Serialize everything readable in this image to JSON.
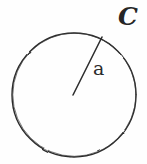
{
  "figure": {
    "kind": "geometry-diagram",
    "background_color": "#fefefe",
    "ink_color": "#262626",
    "labels": {
      "circle_label": "C",
      "radius_label": "a"
    },
    "shapes": {
      "circle": {
        "name": "circle-outline",
        "center_x": 74,
        "center_y": 95,
        "radius": 62,
        "stroke_width": 1.4
      },
      "radius": {
        "name": "radius-segment",
        "x1": 73,
        "y1": 95,
        "x2": 102,
        "y2": 37,
        "stroke_width": 1.5
      }
    }
  }
}
